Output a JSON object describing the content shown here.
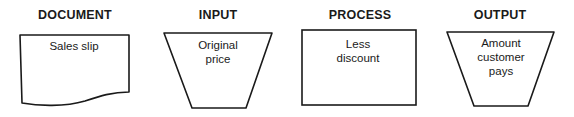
{
  "diagram": {
    "symbols": [
      {
        "heading": "DOCUMENT",
        "shape": "document",
        "text_lines": [
          "Sales slip"
        ]
      },
      {
        "heading": "INPUT",
        "shape": "trapezoid",
        "text_lines": [
          "Original",
          "price"
        ]
      },
      {
        "heading": "PROCESS",
        "shape": "rectangle",
        "text_lines": [
          "Less",
          "discount"
        ]
      },
      {
        "heading": "OUTPUT",
        "shape": "trapezoid",
        "text_lines": [
          "Amount",
          "customer",
          "pays"
        ]
      }
    ],
    "stroke_color": "#1a1a1a",
    "background": "#ffffff"
  }
}
